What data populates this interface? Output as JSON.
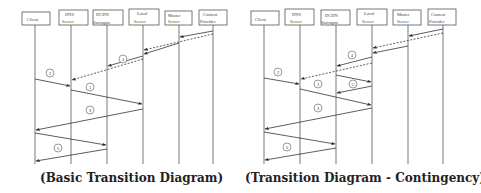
{
  "diagrams": [
    {
      "id": "basic",
      "caption": "(Basic Transition Diagram)",
      "actors": [
        {
          "name": "Client",
          "lines": [
            "Client"
          ]
        },
        {
          "name": "DNS Server",
          "lines": [
            "DNS",
            "Server"
          ]
        },
        {
          "name": "DCDN Surrogate",
          "lines": [
            "DCDN",
            "Surrogate"
          ]
        },
        {
          "name": "Local Server",
          "lines": [
            "Local",
            "Server"
          ]
        },
        {
          "name": "Master Server",
          "lines": [
            "Master",
            "Server"
          ]
        },
        {
          "name": "Content Provider",
          "lines": [
            "Content",
            "Provider"
          ]
        }
      ],
      "steps": [
        {
          "label": "4",
          "from": "Content Provider",
          "to": "Master Server",
          "style": "solid"
        },
        {
          "label": "4",
          "from": "Content Provider",
          "to": "Local Server",
          "style": "dashed"
        },
        {
          "label": "4",
          "from": "Master Server",
          "to": "Local Server",
          "style": "solid"
        },
        {
          "label": "4",
          "from": "Local Server",
          "to": "DCDN Surrogate",
          "style": "solid"
        },
        {
          "label": "4",
          "from": "Local Server",
          "to": "DNS Server",
          "style": "dashed"
        },
        {
          "label": "2",
          "from": "Client",
          "to": "DNS Server",
          "style": "solid"
        },
        {
          "label": "1",
          "from": "DNS Server",
          "to": "Local Server",
          "style": "solid"
        },
        {
          "label": "3",
          "from": "Local Server",
          "to": "Client",
          "style": "solid"
        },
        {
          "label": "5",
          "from": "Client",
          "to": "DCDN Surrogate",
          "style": "solid"
        },
        {
          "label": "5",
          "from": "DCDN Surrogate",
          "to": "Client",
          "style": "solid"
        }
      ]
    },
    {
      "id": "contingency",
      "caption": "(Transition Diagram - Contingency)",
      "actors": [
        {
          "name": "Client",
          "lines": [
            "Client"
          ]
        },
        {
          "name": "DNS Server",
          "lines": [
            "DNS",
            "Server"
          ]
        },
        {
          "name": "DCDN Surrogate",
          "lines": [
            "DCDN",
            "Surrogate"
          ]
        },
        {
          "name": "Local Server",
          "lines": [
            "Local",
            "Server"
          ]
        },
        {
          "name": "Master Server",
          "lines": [
            "Master",
            "Server"
          ]
        },
        {
          "name": "Content Provider",
          "lines": [
            "Content",
            "Provider"
          ]
        }
      ],
      "steps": [
        {
          "label": "4",
          "from": "Content Provider",
          "to": "Master Server",
          "style": "solid"
        },
        {
          "label": "4",
          "from": "Content Provider",
          "to": "Local Server",
          "style": "dashed"
        },
        {
          "label": "4",
          "from": "Master Server",
          "to": "Local Server",
          "style": "solid"
        },
        {
          "label": "4",
          "from": "Local Server",
          "to": "DCDN Surrogate",
          "style": "solid"
        },
        {
          "label": "4",
          "from": "Local Server",
          "to": "DNS Server",
          "style": "dashed"
        },
        {
          "label": "2",
          "from": "Client",
          "to": "DNS Server",
          "style": "solid"
        },
        {
          "label": "C",
          "from": "DCDN Surrogate",
          "to": "Local Server",
          "style": "solid"
        },
        {
          "label": "C",
          "from": "Local Server",
          "to": "DCDN Surrogate",
          "style": "solid"
        },
        {
          "label": "1",
          "from": "DNS Server",
          "to": "Local Server",
          "style": "solid"
        },
        {
          "label": "3",
          "from": "Local Server",
          "to": "Client",
          "style": "solid"
        },
        {
          "label": "5",
          "from": "Client",
          "to": "DCDN Surrogate",
          "style": "solid"
        },
        {
          "label": "5",
          "from": "DCDN Surrogate",
          "to": "Client",
          "style": "solid"
        }
      ]
    }
  ]
}
